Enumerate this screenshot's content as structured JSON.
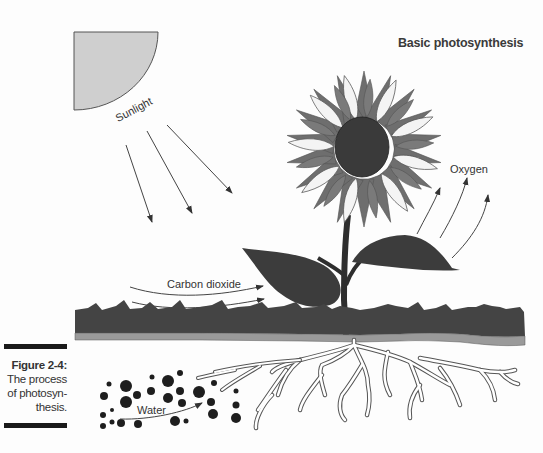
{
  "figure": {
    "title": "Basic photosynthesis",
    "caption": {
      "number": "Figure 2-4:",
      "text": "The process of photosyn-thesis.",
      "lines": [
        "The process",
        "of photosyn-",
        "thesis."
      ]
    }
  },
  "labels": {
    "sunlight": "Sunlight",
    "oxygen": "Oxygen",
    "carbon_dioxide": "Carbon dioxide",
    "water": "Water"
  },
  "icons": {
    "sun": "quarter-circle-sun-icon",
    "flower": "sunflower-icon",
    "leaf": "leaf-icon",
    "roots": "roots-icon",
    "water_droplets": "water-droplets-icon"
  },
  "colors": {
    "sun_fill": "#cfcfcf",
    "petal_dark": "#6e6e6e",
    "petal_light": "#f4f4f4",
    "flower_center": "#3a3a3a",
    "leaf": "#3c3c3c",
    "grass": "#444444",
    "soil_band": "#9a9a9a",
    "water_dots": "#1e1e1e"
  }
}
